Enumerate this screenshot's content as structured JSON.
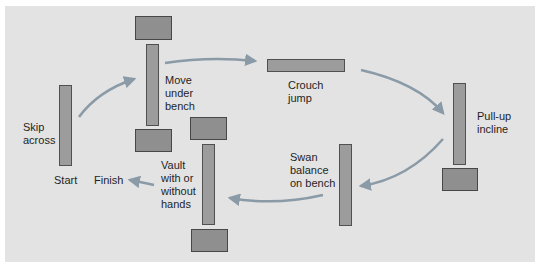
{
  "colors": {
    "panel_bg": "#e3e3e3",
    "bench_fill": "#9c9c9c",
    "box_fill": "#8f8f8f",
    "arrow": "#8a9aa6",
    "text": "#1f1f1f"
  },
  "stations": [
    {
      "id": "skip-across",
      "label": "Skip\nacross"
    },
    {
      "id": "move-under-bench",
      "label": "Move\nunder\nbench"
    },
    {
      "id": "crouch-jump",
      "label": "Crouch\njump"
    },
    {
      "id": "pull-up-incline",
      "label": "Pull-up\nincline"
    },
    {
      "id": "swan-balance",
      "label": "Swan\nbalance\non bench"
    },
    {
      "id": "vault",
      "label": "Vault\nwith or\nwithout\nhands"
    }
  ],
  "markers": {
    "start": "Start",
    "finish": "Finish"
  }
}
